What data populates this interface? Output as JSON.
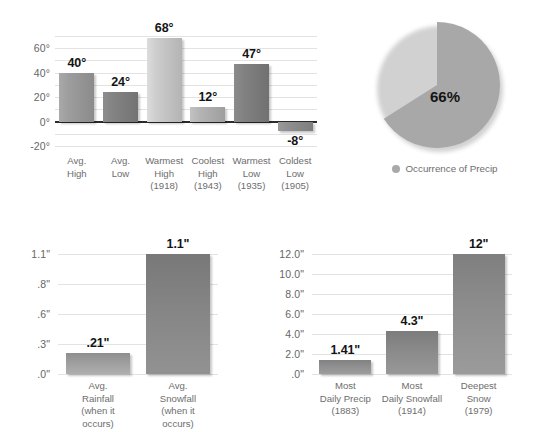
{
  "chart_data": [
    {
      "id": "temperature",
      "type": "bar",
      "title": "",
      "xlabel": "",
      "ylabel": "",
      "ylim": [
        -20,
        70
      ],
      "grid": true,
      "legend": "none",
      "yticks": [
        "60°",
        "40°",
        "20°",
        "0°",
        "-20°"
      ],
      "ytick_values": [
        60,
        40,
        20,
        0,
        -20
      ],
      "gridline_values": [
        70,
        60,
        50,
        40,
        30,
        20,
        10,
        -10,
        -20
      ],
      "categories": [
        "Avg.\nHigh",
        "Avg.\nLow",
        "Warmest\nHigh\n(1918)",
        "Coolest\nHigh\n(1943)",
        "Warmest\nLow\n(1935)",
        "Coldest\nLow\n(1905)"
      ],
      "category_lines": [
        [
          "Avg.",
          "High"
        ],
        [
          "Avg.",
          "Low"
        ],
        [
          "Warmest",
          "High",
          "(1918)"
        ],
        [
          "Coolest",
          "High",
          "(1943)"
        ],
        [
          "Warmest",
          "Low",
          "(1935)"
        ],
        [
          "Coldest",
          "Low",
          "(1905)"
        ]
      ],
      "values": [
        40,
        24,
        68,
        12,
        47,
        -8
      ],
      "value_labels": [
        "40°",
        "24°",
        "68°",
        "12°",
        "47°",
        "-8°"
      ],
      "bar_colors": [
        "#9a9a9a",
        "#808080",
        "#c8c8c8",
        "#b0b0b0",
        "#7e7e7e",
        "#8c8c8c"
      ]
    },
    {
      "id": "precip-occurrence",
      "type": "pie",
      "title": "",
      "legend": "bottom",
      "legend_entries": [
        "Occurrence of Precip"
      ],
      "slices": [
        {
          "label": "Occurrence of Precip",
          "value": 66,
          "display": "66%",
          "color": "#a8a8a8"
        },
        {
          "label": "",
          "value": 34,
          "display": "",
          "color": "#ffffff"
        }
      ],
      "center_label": "66%"
    },
    {
      "id": "average-precip",
      "type": "bar",
      "title": "",
      "xlabel": "",
      "ylabel": "",
      "grid": true,
      "legend": "none",
      "yticks": [
        "1.1\"",
        ".8\"",
        ".6\"",
        ".3\"",
        ".0\""
      ],
      "ytick_values": [
        1.1,
        0.8,
        0.6,
        0.3,
        0.0
      ],
      "categories": [
        "Avg.\nRainfall\n(when it\noccurs)",
        "Avg.\nSnowfall\n(when it\noccurs)"
      ],
      "category_lines": [
        [
          "Avg.",
          "Rainfall",
          "(when it",
          "occurs)"
        ],
        [
          "Avg.",
          "Snowfall",
          "(when it",
          "occurs)"
        ]
      ],
      "values": [
        0.21,
        1.1
      ],
      "value_labels": [
        ".21\"",
        "1.1\""
      ],
      "bar_colors": [
        "#9e9e9e",
        "#858585"
      ]
    },
    {
      "id": "record-precip",
      "type": "bar",
      "title": "",
      "xlabel": "",
      "ylabel": "",
      "ylim": [
        0,
        12
      ],
      "grid": true,
      "legend": "none",
      "yticks": [
        "12.0\"",
        "10.0\"",
        "8.0\"",
        "6.0\"",
        "4.0\"",
        "2.0\"",
        ".0\""
      ],
      "ytick_values": [
        12,
        10,
        8,
        6,
        4,
        2,
        0
      ],
      "categories": [
        "Most\nDaily Precip\n(1883)",
        "Most\nDaily Snowfall\n(1914)",
        "Deepest\nSnow\n(1979)"
      ],
      "category_lines": [
        [
          "Most",
          "Daily Precip",
          "(1883)"
        ],
        [
          "Most",
          "Daily Snowfall",
          "(1914)"
        ],
        [
          "Deepest",
          "Snow",
          "(1979)"
        ]
      ],
      "values": [
        1.41,
        4.3,
        12
      ],
      "value_labels": [
        "1.41\"",
        "4.3\"",
        "12\""
      ],
      "bar_colors": [
        "#8f8f8f",
        "#8a8a8a",
        "#8d8d8d"
      ]
    }
  ],
  "colors": {
    "gridline": "#e3e3e3",
    "zeroline": "#2b2b2b",
    "value_label": "#141414",
    "tick_label": "#666666",
    "category_label": "#6d6d6d",
    "pie_slice": "#a8a8a8",
    "legend_dot": "#a9a9a9",
    "background": "#ffffff"
  }
}
